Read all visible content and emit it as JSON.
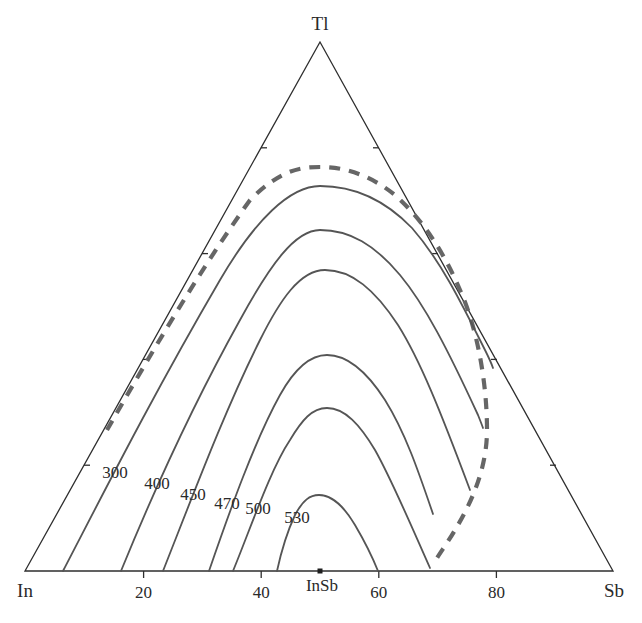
{
  "diagram": {
    "type": "ternary-liquidus-projection",
    "vertices": {
      "top": "Tl",
      "left": "In",
      "right": "Sb"
    },
    "compound": {
      "label": "InSb",
      "position_pct_Sb": 50
    },
    "base_axis": {
      "ticks": [
        "20",
        "40",
        "60",
        "80"
      ]
    },
    "isotherms": [
      {
        "label": "300",
        "unit": "°C"
      },
      {
        "label": "400",
        "unit": "°C"
      },
      {
        "label": "450",
        "unit": "°C"
      },
      {
        "label": "470",
        "unit": "°C"
      },
      {
        "label": "500",
        "unit": "°C"
      },
      {
        "label": "530",
        "unit": "°C"
      }
    ],
    "miscibility_gap": {
      "style": "dashed",
      "color": "#666666"
    },
    "colors": {
      "frame": "#2e2e2e",
      "isotherm": "#555555",
      "dashed": "#666666",
      "background": "#ffffff"
    }
  }
}
